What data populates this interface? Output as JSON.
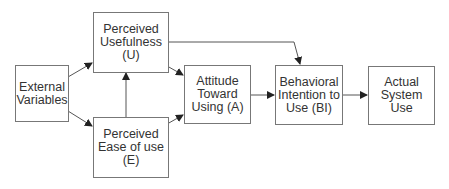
{
  "diagram": {
    "nodes": [
      {
        "id": "external",
        "label": "External\nVariables"
      },
      {
        "id": "pu",
        "label": "Perceived\nUsefulness\n(U)"
      },
      {
        "id": "peou",
        "label": "Perceived\nEase of use\n(E)"
      },
      {
        "id": "attitude",
        "label": "Attitude\nToward\nUsing (A)"
      },
      {
        "id": "bi",
        "label": "Behavioral\nIntention to\nUse (BI)"
      },
      {
        "id": "use",
        "label": "Actual\nSystem Use"
      }
    ],
    "edges": [
      {
        "from": "external",
        "to": "pu"
      },
      {
        "from": "external",
        "to": "peou"
      },
      {
        "from": "peou",
        "to": "pu"
      },
      {
        "from": "pu",
        "to": "attitude"
      },
      {
        "from": "peou",
        "to": "attitude"
      },
      {
        "from": "pu",
        "to": "bi"
      },
      {
        "from": "attitude",
        "to": "bi"
      },
      {
        "from": "bi",
        "to": "use"
      }
    ],
    "colors": {
      "line": "#555555",
      "border": "#777777",
      "text": "#333333"
    }
  }
}
